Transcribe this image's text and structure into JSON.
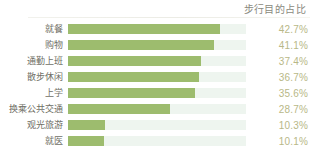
{
  "header": {
    "title": "步行目的占比"
  },
  "chart_data": {
    "type": "bar",
    "orientation": "horizontal",
    "title": "步行目的占比",
    "xlabel": "",
    "ylabel": "",
    "xlim": [
      0,
      50
    ],
    "grid": false,
    "legend": false,
    "bar_color": "#9dbc6e",
    "track_color": "#eef5ef",
    "value_suffix": "%",
    "categories": [
      "就餐",
      "购物",
      "通勤上班",
      "散步休闲",
      "上学",
      "换乘公共交通",
      "观光旅游",
      "就医"
    ],
    "values": [
      42.7,
      41.1,
      37.4,
      36.7,
      35.6,
      28.7,
      10.3,
      10.1
    ],
    "value_labels": [
      "42.7%",
      "41.1%",
      "37.4%",
      "36.7%",
      "35.6%",
      "28.7%",
      "10.3%",
      "10.1%"
    ],
    "rows": [
      {
        "label": "就餐",
        "value": 42.7,
        "value_label": "42.7%"
      },
      {
        "label": "购物",
        "value": 41.1,
        "value_label": "41.1%"
      },
      {
        "label": "通勤上班",
        "value": 37.4,
        "value_label": "37.4%"
      },
      {
        "label": "散步休闲",
        "value": 36.7,
        "value_label": "36.7%"
      },
      {
        "label": "上学",
        "value": 35.6,
        "value_label": "35.6%"
      },
      {
        "label": "换乘公共交通",
        "value": 28.7,
        "value_label": "28.7%"
      },
      {
        "label": "观光旅游",
        "value": 10.3,
        "value_label": "10.3%"
      },
      {
        "label": "就医",
        "value": 10.1,
        "value_label": "10.1%"
      }
    ]
  }
}
